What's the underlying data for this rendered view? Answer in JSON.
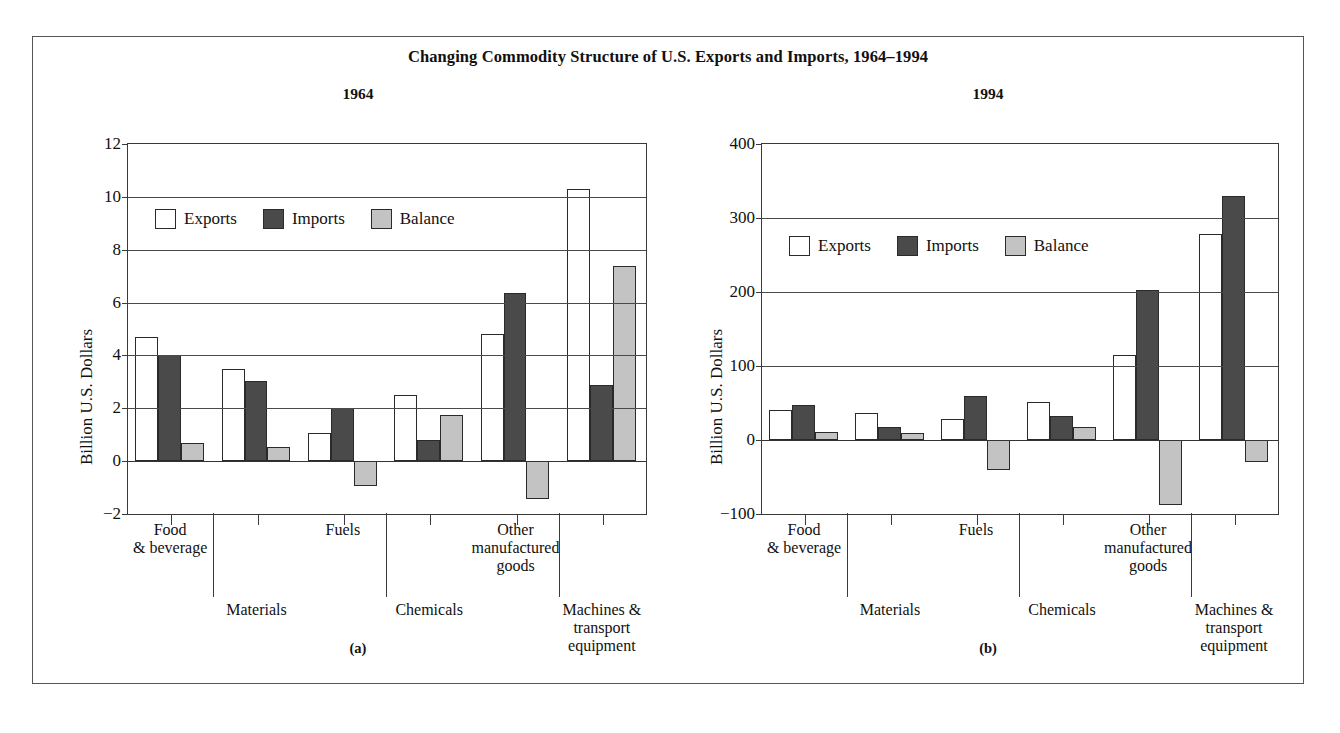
{
  "figure": {
    "title": "Changing Commodity Structure of U.S. Exports and Imports, 1964–1994",
    "panel_a_caption": "(a)",
    "panel_b_caption": "(b)"
  },
  "legend": {
    "exports": "Exports",
    "imports": "Imports",
    "balance": "Balance"
  },
  "categories": {
    "food": "Food\n& beverage",
    "materials": "Materials",
    "fuels": "Fuels",
    "chemicals": "Chemicals",
    "other": "Other\nmanufactured\ngoods",
    "machines": "Machines &\ntransport\nequipment"
  },
  "colors": {
    "exports": "#ffffff",
    "imports": "#4a4a4a",
    "balance": "#c3c3c3",
    "axis": "#3a3a3a",
    "frame": "#555555"
  },
  "chart_data": [
    {
      "type": "bar",
      "title": "1964",
      "panel": "(a)",
      "xlabel": "",
      "ylabel": "Billion U.S. Dollars",
      "ylim": [
        -2,
        12
      ],
      "yticks": [
        -2,
        0,
        2,
        4,
        6,
        8,
        10,
        12
      ],
      "ytick_labels": [
        "−2",
        "0",
        "2",
        "4",
        "6",
        "8",
        "10",
        "12"
      ],
      "grid": true,
      "legend_position": "upper left",
      "categories": [
        "Food & beverage",
        "Materials",
        "Fuels",
        "Chemicals",
        "Other manufactured goods",
        "Machines & transport equipment"
      ],
      "series": [
        {
          "name": "Exports",
          "values": [
            4.7,
            3.5,
            1.05,
            2.5,
            4.8,
            10.3
          ]
        },
        {
          "name": "Imports",
          "values": [
            4.0,
            3.05,
            2.0,
            0.8,
            6.35,
            2.9
          ]
        },
        {
          "name": "Balance",
          "values": [
            0.7,
            0.55,
            -0.95,
            1.75,
            -1.45,
            7.4
          ]
        }
      ]
    },
    {
      "type": "bar",
      "title": "1994",
      "panel": "(b)",
      "xlabel": "",
      "ylabel": "Billion U.S. Dollars",
      "ylim": [
        -100,
        400
      ],
      "yticks": [
        -100,
        0,
        100,
        200,
        300,
        400
      ],
      "ytick_labels": [
        "−100",
        "0",
        "100",
        "200",
        "300",
        "400"
      ],
      "grid": true,
      "legend_position": "upper left",
      "categories": [
        "Food & beverage",
        "Materials",
        "Fuels",
        "Chemicals",
        "Other manufactured goods",
        "Machines & transport equipment"
      ],
      "series": [
        {
          "name": "Exports",
          "values": [
            40,
            36,
            28,
            52,
            115,
            278
          ]
        },
        {
          "name": "Imports",
          "values": [
            47,
            18,
            60,
            32,
            203,
            330
          ]
        },
        {
          "name": "Balance",
          "values": [
            11,
            9,
            -40,
            17,
            -88,
            -30
          ]
        }
      ]
    }
  ]
}
